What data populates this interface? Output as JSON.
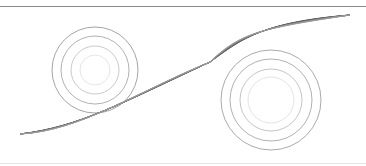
{
  "figure": {
    "colors": {
      "top_rule": "#8a8a8a",
      "bottom_rule": "#e4e4e4",
      "ribbon": "#555555"
    },
    "circle_groups": [
      {
        "name": "left",
        "cx": 95,
        "cy": 70,
        "rings": [
          {
            "r": 43,
            "color": "#9a9a9a"
          },
          {
            "r": 34,
            "color": "#a8a8a8"
          },
          {
            "r": 24,
            "color": "#c4c4c4"
          },
          {
            "r": 15,
            "color": "#e2e2e2"
          }
        ]
      },
      {
        "name": "right",
        "cx": 271,
        "cy": 100,
        "rings": [
          {
            "r": 50,
            "color": "#a0a0a0"
          },
          {
            "r": 41,
            "color": "#a8a8a8"
          },
          {
            "r": 31,
            "color": "#bdbdbd"
          },
          {
            "r": 23,
            "color": "#e0e0e0"
          }
        ]
      }
    ],
    "ribbon": {
      "start": [
        20,
        134
      ],
      "cross": [
        210,
        62
      ],
      "end": [
        350,
        15
      ],
      "strands": 16
    }
  }
}
